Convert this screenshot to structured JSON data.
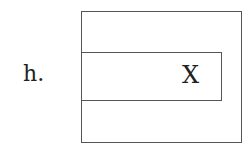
{
  "figure": {
    "label": "h.",
    "outer_box": {
      "description": "outer rectangle"
    },
    "inner_box": {
      "description": "inner horizontal rectangle sharing left edge with outer box",
      "mark": "X"
    }
  }
}
